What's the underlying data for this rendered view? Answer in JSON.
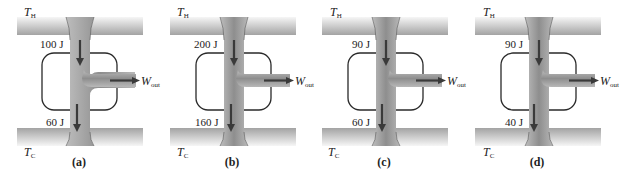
{
  "figure": {
    "colors": {
      "reservoir_light": "#f4f4f4",
      "reservoir_dark": "#a6a6a6",
      "flow_dark": "#8c8c8c",
      "flow_light": "#c4c4c4",
      "arrow": "#3a3a3a",
      "engine_outline": "#2a2a2a",
      "text": "#222222"
    },
    "panels": [
      {
        "caption": "(a)",
        "hot_label": "T",
        "hot_sub": "H",
        "cold_label": "T",
        "cold_sub": "C",
        "q_in": "100 J",
        "q_out": "60 J",
        "work_label": "W",
        "work_sub": "out"
      },
      {
        "caption": "(b)",
        "hot_label": "T",
        "hot_sub": "H",
        "cold_label": "T",
        "cold_sub": "C",
        "q_in": "200 J",
        "q_out": "160 J",
        "work_label": "W",
        "work_sub": "out"
      },
      {
        "caption": "(c)",
        "hot_label": "T",
        "hot_sub": "H",
        "cold_label": "T",
        "cold_sub": "C",
        "q_in": "90 J",
        "q_out": "60 J",
        "work_label": "W",
        "work_sub": "out"
      },
      {
        "caption": "(d)",
        "hot_label": "T",
        "hot_sub": "H",
        "cold_label": "T",
        "cold_sub": "C",
        "q_in": "90 J",
        "q_out": "40 J",
        "work_label": "W",
        "work_sub": "out"
      }
    ]
  }
}
